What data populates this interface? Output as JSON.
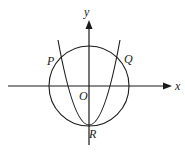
{
  "diagram": {
    "type": "coordinate-geometry",
    "colors": {
      "stroke": "#1a1a1a",
      "background": "#ffffff"
    },
    "axes": {
      "x_label": "x",
      "y_label": "y",
      "origin_label": "O"
    },
    "points": {
      "P": "P",
      "Q": "Q",
      "R": "R"
    },
    "shapes": [
      "circle",
      "parabola"
    ]
  }
}
